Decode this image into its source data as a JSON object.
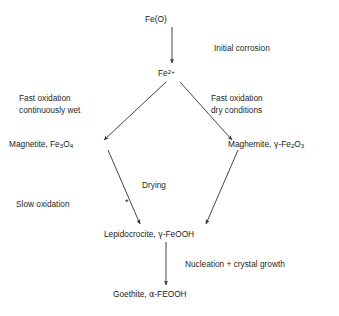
{
  "diagram": {
    "background_color": "#ffffff",
    "line_color": "#3a3a3a",
    "text_color": "#1a1a1a",
    "nodes": [
      {
        "id": "fe0",
        "label": "Fe(O)",
        "base": "Fe(O)"
      },
      {
        "id": "fe2",
        "label": "Fe2+",
        "base": "Fe",
        "sup": "2+"
      },
      {
        "id": "magnetite",
        "label": "Magnetite, Fe3O4",
        "name": "Magnetite, Fe",
        "sub1": "3",
        "mid": "O",
        "sub2": "4"
      },
      {
        "id": "maghemite",
        "label": "Maghemite, y-Fe2O3",
        "name": "Maghemite, ",
        "greek": "γ",
        "dash": "-Fe",
        "sub1": "2",
        "mid": "O",
        "sub2": "3"
      },
      {
        "id": "lepidocrocite",
        "label": "Lepidocrocite, y-FeOOH",
        "name": "Lepidocrocite, ",
        "greek": "γ",
        "rest": "-FeOOH"
      },
      {
        "id": "goethite",
        "label": "Goethite, a-FEOOH",
        "name": "Goethite, ",
        "greek": "α",
        "rest": "-FEOOH"
      }
    ],
    "edge_labels": [
      {
        "id": "initial-corrosion",
        "text": "Initial corrosion"
      },
      {
        "id": "fast-oxidation-wet",
        "text": "Fast oxidation\ncontinuously wet"
      },
      {
        "id": "fast-oxidation-dry",
        "text": "Fast oxidation\ndry conditions"
      },
      {
        "id": "drying",
        "text": "Drying"
      },
      {
        "id": "slow-oxidation",
        "text": "Slow oxidation"
      },
      {
        "id": "nucleation",
        "text": "Nucleation + crystal growth"
      }
    ],
    "markers": [
      {
        "id": "asterisk",
        "text": "*"
      }
    ],
    "arrows": [
      {
        "id": "fe0-to-fe2",
        "from": "fe0",
        "to": "fe2",
        "x1": 172,
        "y1": 27,
        "x2": 172,
        "y2": 63
      },
      {
        "id": "fe2-to-magnetite",
        "from": "fe2",
        "to": "magnetite",
        "x1": 166,
        "y1": 82,
        "x2": 104,
        "y2": 140
      },
      {
        "id": "fe2-to-maghemite",
        "from": "fe2",
        "to": "maghemite",
        "x1": 180,
        "y1": 82,
        "x2": 232,
        "y2": 140
      },
      {
        "id": "magnetite-to-lepidocrocite",
        "from": "magnetite",
        "to": "lepidocrocite",
        "x1": 108,
        "y1": 150,
        "x2": 140,
        "y2": 224
      },
      {
        "id": "maghemite-to-lepidocrocite",
        "from": "maghemite",
        "to": "lepidocrocite",
        "x1": 238,
        "y1": 150,
        "x2": 206,
        "y2": 224
      },
      {
        "id": "lepidocrocite-to-goethite",
        "from": "lepidocrocite",
        "to": "goethite",
        "x1": 166,
        "y1": 242,
        "x2": 166,
        "y2": 285
      }
    ]
  }
}
